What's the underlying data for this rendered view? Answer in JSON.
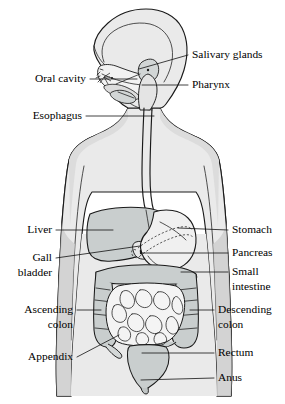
{
  "figure": {
    "orientation": "head in left profile above front-facing torso",
    "style": "grayscale line drawing with leader-line callouts"
  },
  "colors": {
    "background": "#ffffff",
    "body_fill": "#eaeaea",
    "body_shade": "#c9cece",
    "organ_light": "#f2f2f2",
    "organ_mid": "#d8dcdc",
    "organ_dark": "#bfc6c6",
    "outline": "#1a1a1a",
    "leader_line": "#111111",
    "label_text": "#000000"
  },
  "labels": {
    "left": [
      {
        "id": "oral-cavity",
        "lines": [
          "Oral cavity"
        ],
        "x": 86,
        "y": 79,
        "leader": "M90,79 L137,79"
      },
      {
        "id": "esophagus",
        "lines": [
          "Esophagus"
        ],
        "x": 82,
        "y": 116,
        "leader": "M86,116 L154,116"
      },
      {
        "id": "liver",
        "lines": [
          "Liver"
        ],
        "x": 52,
        "y": 230,
        "leader": "M56,230 L113,230"
      },
      {
        "id": "gall-bladder",
        "lines": [
          "Gall",
          "bladder"
        ],
        "x": 52,
        "y": 258,
        "leader": "M56,258 L140,245"
      },
      {
        "id": "ascending-colon",
        "lines": [
          "Ascending",
          "colon"
        ],
        "x": 73,
        "y": 310,
        "leader": "M77,310 L101,310"
      },
      {
        "id": "appendix",
        "lines": [
          "Appendix"
        ],
        "x": 73,
        "y": 357,
        "leader": "M77,357 L118,334"
      }
    ],
    "right": [
      {
        "id": "salivary-glands",
        "lines": [
          "Salivary glands"
        ],
        "x": 192,
        "y": 55,
        "leader": "M188,55 L139,69"
      },
      {
        "id": "pharynx",
        "lines": [
          "Pharynx"
        ],
        "x": 192,
        "y": 85,
        "leader": "M188,85 L141,85"
      },
      {
        "id": "stomach",
        "lines": [
          "Stomach"
        ],
        "x": 232,
        "y": 230,
        "leader": "M228,230 L178,228"
      },
      {
        "id": "pancreas",
        "lines": [
          "Pancreas"
        ],
        "x": 232,
        "y": 253,
        "leader": "M228,253 L141,253"
      },
      {
        "id": "small-intestine",
        "lines": [
          "Small",
          "intestine"
        ],
        "x": 232,
        "y": 275,
        "leader": "M228,272 L180,272"
      },
      {
        "id": "descending-colon",
        "lines": [
          "Descending",
          "colon"
        ],
        "x": 218,
        "y": 310,
        "leader": "M214,310 L190,310"
      },
      {
        "id": "rectum",
        "lines": [
          "Rectum"
        ],
        "x": 218,
        "y": 353,
        "leader": "M214,353 L141,353"
      },
      {
        "id": "anus",
        "lines": [
          "Anus"
        ],
        "x": 218,
        "y": 378,
        "leader": "M214,378 L140,378"
      }
    ]
  },
  "organs": {
    "head": "skull profile with nasal cavity, palate and tongue",
    "salivary_glands": "parotid and submandibular glands near jaw",
    "pharynx": "throat passage behind tongue",
    "esophagus": "vertical tube from pharynx through neck and chest",
    "stomach": "J-shaped sac upper right of abdomen",
    "liver": "large shaded wedge upper left of abdomen",
    "gall_bladder": "small sac beneath liver",
    "pancreas": "dashed elongated organ behind stomach",
    "small_intestine": "coiled loops filling central abdomen",
    "ascending_colon": "vertical colon on left side of image",
    "descending_colon": "vertical colon on right side of image",
    "transverse_colon": "horizontal colon above small intestine",
    "appendix": "small projection at base of ascending colon",
    "rectum": "tapering terminal segment",
    "anus": "point at base of rectum"
  }
}
